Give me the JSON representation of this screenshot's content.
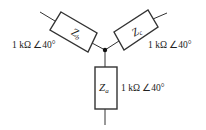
{
  "diagram": {
    "type": "wye-impedance-network",
    "junction": {
      "x": 105,
      "y": 50
    },
    "impedances": [
      {
        "name": "Z",
        "subscript": "a",
        "value": "1 kΩ ∠40°",
        "orientation": "vertical-down"
      },
      {
        "name": "Z",
        "subscript": "b",
        "value": "1 kΩ ∠40°",
        "orientation": "upper-left"
      },
      {
        "name": "Z",
        "subscript": "c",
        "value": "1 kΩ ∠40°",
        "orientation": "upper-right"
      }
    ],
    "colors": {
      "stroke": "#333333",
      "background": "#ffffff",
      "text": "#222222"
    }
  }
}
